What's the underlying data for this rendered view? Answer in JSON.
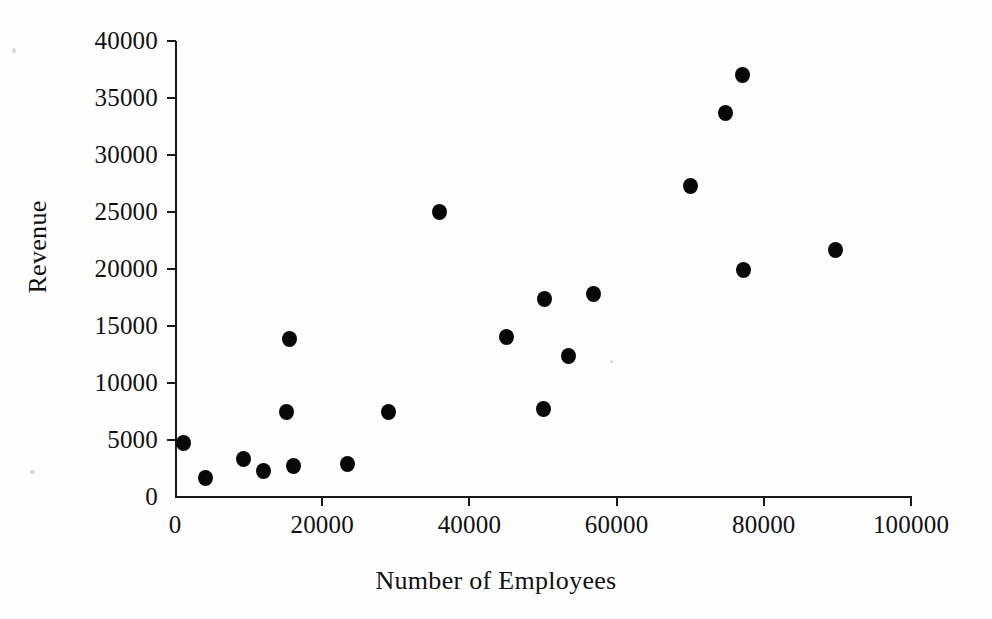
{
  "chart_data": {
    "type": "scatter",
    "title": "",
    "xlabel": "Number of Employees",
    "ylabel": "Revenue",
    "xlim": [
      0,
      100000
    ],
    "ylim": [
      0,
      40000
    ],
    "xticks": [
      0,
      20000,
      40000,
      60000,
      80000,
      100000
    ],
    "yticks": [
      0,
      5000,
      10000,
      15000,
      20000,
      25000,
      30000,
      35000,
      40000
    ],
    "xtick_labels": [
      "0",
      "20000",
      "40000",
      "60000",
      "80000",
      "100000"
    ],
    "ytick_labels": [
      "0",
      "5000",
      "10000",
      "15000",
      "20000",
      "25000",
      "30000",
      "35000",
      "40000"
    ],
    "grid": false,
    "legend": false,
    "marker": "filled-circle",
    "marker_color": "#080808",
    "points": [
      {
        "x": 1100,
        "y": 4700
      },
      {
        "x": 4200,
        "y": 1700
      },
      {
        "x": 9300,
        "y": 3300
      },
      {
        "x": 12000,
        "y": 2300
      },
      {
        "x": 15200,
        "y": 7500
      },
      {
        "x": 15600,
        "y": 13900
      },
      {
        "x": 16100,
        "y": 2700
      },
      {
        "x": 23500,
        "y": 2900
      },
      {
        "x": 29000,
        "y": 7500
      },
      {
        "x": 36000,
        "y": 25000
      },
      {
        "x": 45000,
        "y": 14000
      },
      {
        "x": 50000,
        "y": 7700
      },
      {
        "x": 50200,
        "y": 17400
      },
      {
        "x": 53500,
        "y": 12400
      },
      {
        "x": 56800,
        "y": 17800
      },
      {
        "x": 70000,
        "y": 27300
      },
      {
        "x": 74800,
        "y": 33700
      },
      {
        "x": 77100,
        "y": 37000
      },
      {
        "x": 77200,
        "y": 19900
      },
      {
        "x": 89700,
        "y": 21700
      }
    ]
  },
  "axes": {
    "x_title": "Number of Employees",
    "y_title": "Revenue"
  },
  "colors": {
    "marker": "#080808",
    "axis": "#1a1a1a",
    "background": "#fefefe",
    "text": "#111111"
  }
}
